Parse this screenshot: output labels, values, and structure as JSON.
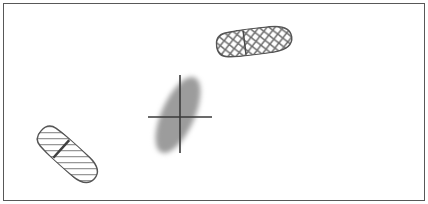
{
  "figure": {
    "width": 428,
    "height": 204,
    "background_color": "#ffffff",
    "border_color": "#585858",
    "border_width": 1,
    "border_inset": 3,
    "title": "",
    "caption": ""
  },
  "palette": {
    "outline": "#555555",
    "hatch_line": "#666666",
    "crosshatch_line": "#6b6b6b",
    "blob_fill": "#9c9c9c",
    "crosshair": "#3a3a3a",
    "divider": "#4a4a4a",
    "white": "#ffffff"
  },
  "elements": [
    {
      "id": "shoeprint-top-right",
      "name": "shoeprint-crosshatch",
      "label": "",
      "pattern": "crosshatch",
      "fill": "none",
      "outline_color": "#555555",
      "hatch_color": "#6b6b6b",
      "center_x": 254.5,
      "center_y": 41.5,
      "length": 78,
      "width": 27,
      "rotation_deg": -7,
      "divider_offset": -10
    },
    {
      "id": "shoeprint-bottom-left",
      "name": "shoeprint-diagonal-hatch",
      "label": "",
      "pattern": "diagonal-lines",
      "fill": "none",
      "outline_color": "#555555",
      "hatch_color": "#666666",
      "center_x": 68,
      "center_y": 155,
      "length": 74,
      "width": 27,
      "rotation_deg": 42,
      "divider_offset": -9
    },
    {
      "id": "impression-blob",
      "name": "gray-impression-blob",
      "label": "",
      "pattern": "solid-soft",
      "fill": "#9c9c9c",
      "center_x": 178,
      "center_y": 115,
      "length": 82,
      "width": 33,
      "rotation_deg": 24
    }
  ],
  "crosshair": {
    "name": "crosshair-marker",
    "color": "#3a3a3a",
    "stroke_width": 1.6,
    "horizontal": {
      "x1": 148,
      "x2": 212,
      "y": 117
    },
    "vertical": {
      "y1": 75,
      "y2": 153,
      "x": 180
    }
  }
}
